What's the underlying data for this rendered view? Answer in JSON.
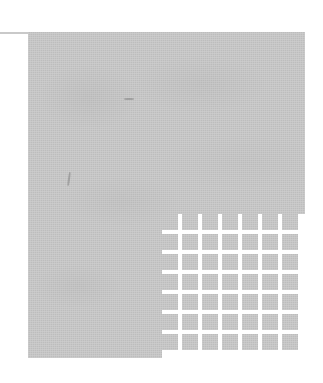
{
  "figure": {
    "type": "abstract-scanned-figure",
    "canvas": {
      "width": 323,
      "height": 383,
      "background_color": "#ffffff"
    },
    "rule_line": {
      "name": "horizontal-rule",
      "x": 0,
      "y": 32,
      "width": 29,
      "height": 2,
      "color": "#c9c9c9"
    },
    "plate": {
      "name": "gray-plate",
      "x": 28,
      "y": 32,
      "width": 277,
      "height": 326,
      "fill_color": "#bdbdbd"
    },
    "grid": {
      "name": "cell-grid",
      "x": 162,
      "y": 214,
      "width": 143,
      "height": 144,
      "rows": 7,
      "columns": 7,
      "cell_count": 49,
      "cell_size": 16,
      "gutter": 4,
      "cell_color": "#bdbdbd",
      "gutter_color": "#ffffff",
      "cells": [
        [
          "r1c1",
          "r1c2",
          "r1c3",
          "r1c4",
          "r1c5",
          "r1c6",
          "r1c7"
        ],
        [
          "r2c1",
          "r2c2",
          "r2c3",
          "r2c4",
          "r2c5",
          "r2c6",
          "r2c7"
        ],
        [
          "r3c1",
          "r3c2",
          "r3c3",
          "r3c4",
          "r3c5",
          "r3c6",
          "r3c7"
        ],
        [
          "r4c1",
          "r4c2",
          "r4c3",
          "r4c4",
          "r4c5",
          "r4c6",
          "r4c7"
        ],
        [
          "r5c1",
          "r5c2",
          "r5c3",
          "r5c4",
          "r5c5",
          "r5c6",
          "r5c7"
        ],
        [
          "r6c1",
          "r6c2",
          "r6c3",
          "r6c4",
          "r6c5",
          "r6c6",
          "r6c7"
        ],
        [
          "r7c1",
          "r7c2",
          "r7c3",
          "r7c4",
          "r7c5",
          "r7c6",
          "r7c7"
        ]
      ]
    },
    "specks": [
      {
        "name": "speck-mark-1",
        "x": 40,
        "y": 140
      },
      {
        "name": "speck-mark-2",
        "x": 149,
        "y": 228
      },
      {
        "name": "speck-mark-3",
        "x": 96,
        "y": 66
      }
    ],
    "text": []
  }
}
